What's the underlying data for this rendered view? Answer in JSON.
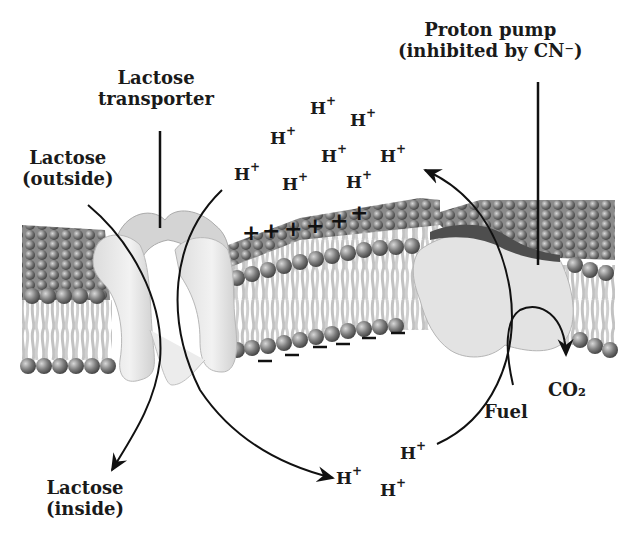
{
  "labels": {
    "lactose_transporter": [
      "Lactose",
      "transporter"
    ],
    "lactose_outside": [
      "Lactose",
      "(outside)"
    ],
    "lactose_inside": [
      "Lactose",
      "(inside)"
    ],
    "proton_pump": [
      "Proton pump",
      "(inhibited by CN⁻)"
    ],
    "fuel": "Fuel",
    "co2": "CO₂"
  },
  "ions": {
    "proton_symbol": "H",
    "proton_charge": "+",
    "outside_protons_count": 8,
    "inside_protons_count": 3,
    "positive_charges": "+ + + + + +",
    "negative_charges": "− − − − − − −"
  },
  "colors": {
    "lipid_head": "#7a7a7a",
    "lipid_tail": "#c4c4c4",
    "protein": "#e6e6e6",
    "pump_cap": "#5a5a5a",
    "text": "#1a1a1a"
  }
}
